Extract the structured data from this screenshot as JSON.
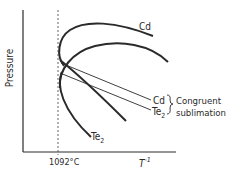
{
  "diagram": {
    "y_axis_label": "Pressure",
    "x_axis_label": "T",
    "x_axis_label_superscript": "-1",
    "marker_label": "1092°C",
    "curve_labels": {
      "cd_curve": "Cd",
      "te2_curve": "Te",
      "te2_curve_subscript": "2"
    },
    "line_labels": {
      "cd_line": "Cd",
      "te2_line": "Te",
      "te2_line_subscript": "2"
    },
    "annotation": {
      "line1": "Congruent",
      "line2": "sublimation"
    },
    "colors": {
      "ink": "#2a2a2a",
      "background": "#ffffff"
    }
  }
}
